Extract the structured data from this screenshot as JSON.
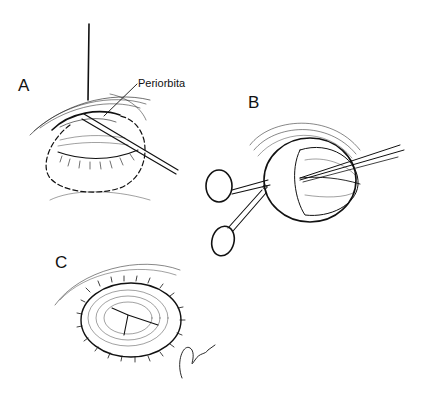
{
  "figure": {
    "panels": [
      {
        "id": "A",
        "label": "A",
        "description": "Closed eyelid with dashed incision outline; needle/probe inserted along periorbita"
      },
      {
        "id": "B",
        "label": "B",
        "description": "Globe being dissected with scissors and forceps"
      },
      {
        "id": "C",
        "label": "C",
        "description": "Orbit closed with interrupted sutures"
      }
    ],
    "annotations": [
      {
        "text": "Periorbita",
        "panel": "A"
      }
    ],
    "signature": "Gley '84",
    "colors": {
      "ink": "#111111",
      "background": "#ffffff"
    }
  }
}
